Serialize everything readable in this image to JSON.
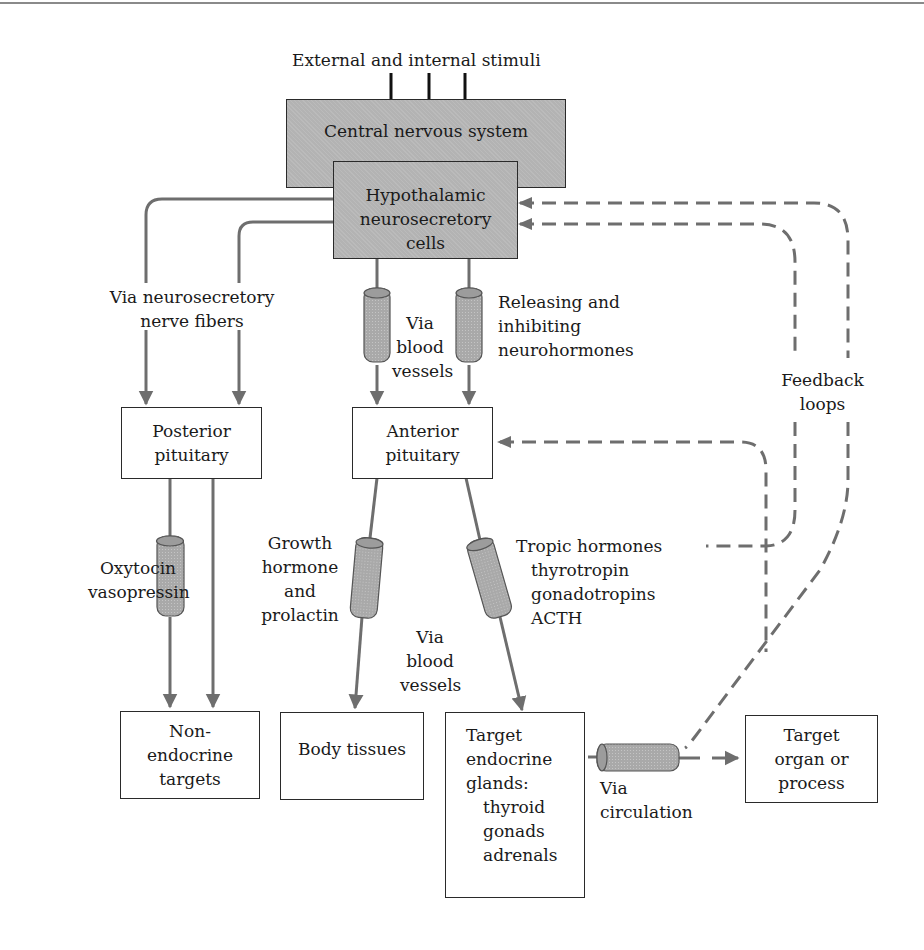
{
  "diagram": {
    "title_input": "External and internal stimuli",
    "colors": {
      "box_fill_gray": "#b3b3b3",
      "connector": "#6e6e6e",
      "stimulus_arrow": "#111111",
      "border": "#2a2a2a"
    },
    "boxes": {
      "cns": {
        "label": "Central nervous system"
      },
      "hypothalamic": {
        "lines": [
          "Hypothalamic",
          "neurosecretory",
          "cells"
        ]
      },
      "posterior": {
        "lines": [
          "Posterior",
          "pituitary"
        ]
      },
      "anterior": {
        "lines": [
          "Anterior",
          "pituitary"
        ]
      },
      "nonendocrine": {
        "lines": [
          "Non-",
          "endocrine",
          "targets"
        ]
      },
      "body": {
        "label": "Body tissues"
      },
      "target_glands": {
        "lines": [
          "Target",
          "endocrine",
          "glands:",
          "thyroid",
          "gonads",
          "adrenals"
        ]
      },
      "target_organ": {
        "lines": [
          "Target",
          "organ or",
          "process"
        ]
      }
    },
    "labels": {
      "neurosecretory": [
        "Via neurosecretory",
        "nerve fibers"
      ],
      "via_blood_top": [
        "Via",
        "blood",
        "vessels"
      ],
      "releasing": [
        "Releasing and",
        "inhibiting",
        "neurohormones"
      ],
      "feedback": [
        "Feedback",
        "loops"
      ],
      "oxytocin": [
        "Oxytocin",
        "vasopressin"
      ],
      "growth": [
        "Growth",
        "hormone",
        "and",
        "prolactin"
      ],
      "via_blood_mid": [
        "Via",
        "blood",
        "vessels"
      ],
      "tropic": [
        "Tropic hormones",
        "thyrotropin",
        "gonadotropins",
        "ACTH"
      ],
      "circulation": [
        "Via",
        "circulation"
      ]
    },
    "icons": [
      "stimulus-arrow-icon",
      "vessel-cylinder-icon",
      "arrowhead-icon",
      "dashed-feedback-arrow-icon"
    ]
  }
}
